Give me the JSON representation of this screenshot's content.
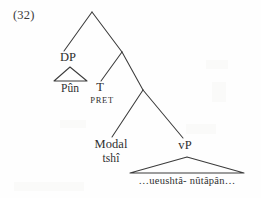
{
  "figure": {
    "example_number": "(32)",
    "language_note": "",
    "ink_color": "#2f2f2f",
    "background_color": "#fefefe"
  },
  "tree": {
    "nodes": [
      {
        "id": "root",
        "label": "",
        "x": 92,
        "y": 12,
        "type": "branching"
      },
      {
        "id": "dp",
        "label": "DP",
        "x": 68,
        "y": 58,
        "type": "phrase"
      },
      {
        "id": "tbar",
        "label": "",
        "x": 122,
        "y": 52,
        "type": "branching"
      },
      {
        "id": "t",
        "label": "T",
        "x": 100,
        "y": 88,
        "type": "head"
      },
      {
        "id": "tfeat",
        "label": "PRET",
        "x": 102,
        "y": 101,
        "type": "feature"
      },
      {
        "id": "modp",
        "label": "",
        "x": 143,
        "y": 90,
        "type": "branching"
      },
      {
        "id": "modal",
        "label": "Modal",
        "x": 111,
        "y": 145,
        "type": "head"
      },
      {
        "id": "modalw",
        "label": "tshî",
        "x": 111,
        "y": 159,
        "type": "word"
      },
      {
        "id": "vp",
        "label": "vP",
        "x": 185,
        "y": 145,
        "type": "phrase"
      }
    ],
    "edges": [
      {
        "from": "root",
        "to": "dp",
        "x1": 92,
        "y1": 12,
        "x2": 64,
        "y2": 51
      },
      {
        "from": "root",
        "to": "tbar",
        "x1": 92,
        "y1": 12,
        "x2": 122,
        "y2": 52
      },
      {
        "from": "tbar",
        "to": "t",
        "x1": 122,
        "y1": 52,
        "x2": 101,
        "y2": 81
      },
      {
        "from": "tbar",
        "to": "modp",
        "x1": 122,
        "y1": 52,
        "x2": 143,
        "y2": 90
      },
      {
        "from": "modp",
        "to": "modal",
        "x1": 143,
        "y1": 90,
        "x2": 112,
        "y2": 137
      },
      {
        "from": "modp",
        "to": "vp",
        "x1": 143,
        "y1": 90,
        "x2": 183,
        "y2": 138
      }
    ],
    "triangles": [
      {
        "id": "dp-triangle",
        "apex_x": 70,
        "apex_y": 67,
        "left_x": 54,
        "right_x": 87,
        "base_y": 81
      },
      {
        "id": "vp-triangle",
        "apex_x": 187,
        "apex_y": 157,
        "left_x": 130,
        "right_x": 244,
        "base_y": 173
      }
    ],
    "terminals": [
      {
        "id": "dp-terminal",
        "text": "Pûn",
        "x": 70,
        "y": 83
      },
      {
        "id": "vp-terminal",
        "text": "…ueushtâ- nûtâpân…",
        "x": 187,
        "y": 177
      }
    ]
  }
}
